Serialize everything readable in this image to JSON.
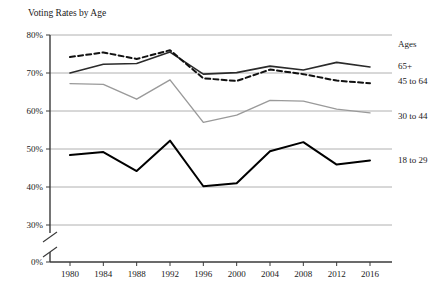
{
  "chart_data": {
    "type": "line",
    "title": "Voting Rates by Age",
    "xlabel": "",
    "ylabel": "",
    "categories": [
      "1980",
      "1984",
      "1988",
      "1992",
      "1996",
      "2000",
      "2004",
      "2008",
      "2012",
      "2016"
    ],
    "x": [
      1980,
      1984,
      1988,
      1992,
      1996,
      2000,
      2004,
      2008,
      2012,
      2016
    ],
    "ylim": [
      30,
      80
    ],
    "ytick_labels": [
      "80%",
      "70%",
      "60%",
      "50%",
      "40%",
      "30%",
      "0%"
    ],
    "ytick_values": [
      80,
      70,
      60,
      50,
      40,
      30,
      0
    ],
    "axis_break": true,
    "axis_break_note": "y-axis broken between 30% and 0%",
    "grid": true,
    "grid_axis": "y",
    "legend_position": "right",
    "legend_title": "Ages",
    "series": [
      {
        "name": "65+",
        "style": "solid",
        "color": "#2b2b2b",
        "width": 1.6,
        "values": [
          70.0,
          72.3,
          72.5,
          75.5,
          69.7,
          70.1,
          71.8,
          70.8,
          72.8,
          71.6
        ],
        "label_y": 69
      },
      {
        "name": "45 to 64",
        "style": "dashed",
        "color": "#111111",
        "width": 2.0,
        "values": [
          74.2,
          75.4,
          73.7,
          76.0,
          68.6,
          67.9,
          70.9,
          69.7,
          68.0,
          67.3
        ],
        "label_y": 84
      },
      {
        "name": "30 to 44",
        "style": "solid",
        "color": "#9a9a9a",
        "width": 1.4,
        "values": [
          67.2,
          67.0,
          63.1,
          68.2,
          57.0,
          58.9,
          62.8,
          62.6,
          60.5,
          59.5
        ],
        "label_y": 119
      },
      {
        "name": "18 to 29",
        "style": "solid",
        "color": "#000000",
        "width": 2.0,
        "values": [
          48.4,
          49.2,
          44.2,
          52.2,
          40.2,
          41.0,
          49.4,
          51.8,
          45.9,
          47.0
        ],
        "label_y": 163
      }
    ]
  },
  "colors": {
    "grid": "#9c9c9c",
    "axis": "#3a3a3a",
    "text": "#1a1a1a",
    "background": "#ffffff"
  }
}
